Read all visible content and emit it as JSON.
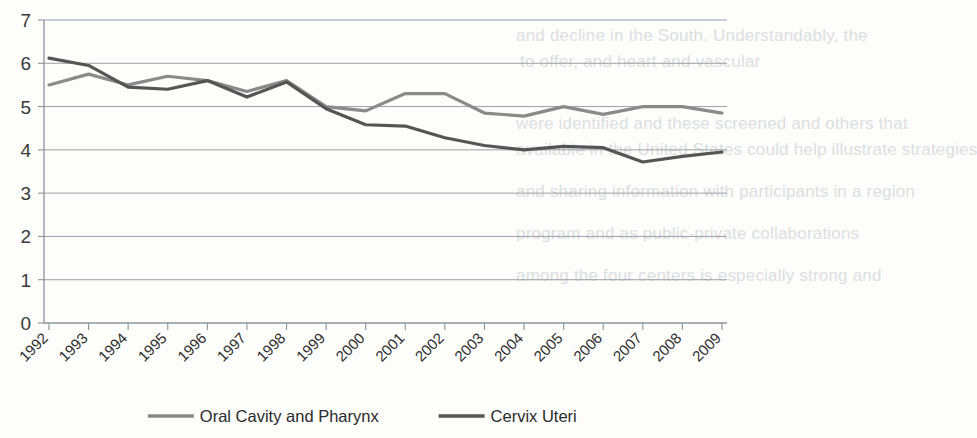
{
  "chart_data": {
    "type": "line",
    "title": "",
    "subtitle": "",
    "xlabel": "",
    "ylabel": "",
    "categories": [
      "1992",
      "1993",
      "1994",
      "1995",
      "1996",
      "1997",
      "1998",
      "1999",
      "2000",
      "2001",
      "2002",
      "2003",
      "2004",
      "2005",
      "2006",
      "2007",
      "2008",
      "2009"
    ],
    "ylim": [
      0,
      7
    ],
    "ytick_labels": [
      "0",
      "1",
      "2",
      "3",
      "4",
      "5",
      "6",
      "7"
    ],
    "ytick_values": [
      0,
      1,
      2,
      3,
      4,
      5,
      6,
      7
    ],
    "grid": true,
    "legend_position": "bottom",
    "series": [
      {
        "name": "Oral Cavity and Pharynx",
        "color": "#8a8a8a",
        "values": [
          5.5,
          5.75,
          5.5,
          5.7,
          5.6,
          5.35,
          5.6,
          5.0,
          4.9,
          5.3,
          5.3,
          4.85,
          4.78,
          5.0,
          4.82,
          5.0,
          5.0,
          4.85
        ]
      },
      {
        "name": "Cervix Uteri",
        "color": "#555555",
        "values": [
          6.12,
          5.95,
          5.45,
          5.4,
          5.6,
          5.22,
          5.57,
          4.95,
          4.58,
          4.55,
          4.28,
          4.1,
          4.0,
          4.08,
          4.05,
          3.72,
          3.85,
          3.95
        ]
      }
    ],
    "legend": [
      {
        "label": "Oral Cavity and Pharynx",
        "color": "#8a8a8a"
      },
      {
        "label": "Cervix Uteri",
        "color": "#555555"
      }
    ]
  },
  "bleed_text": {
    "lines": [
      "and decline in the South. Understandably, the",
      "to offer, and heart and vascular",
      "were identified and these screened and others that",
      "available in the United States could help illustrate strategies",
      "and sharing information with participants in a region",
      "program and as public-private collaborations",
      "among the four centers is especially strong and"
    ]
  }
}
